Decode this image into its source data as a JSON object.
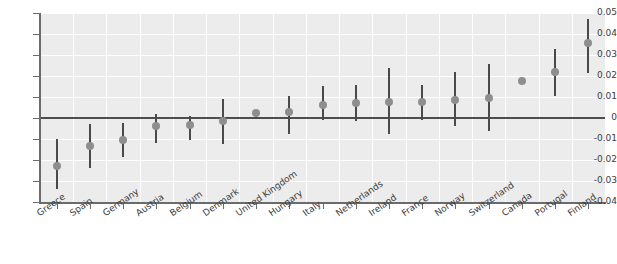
{
  "chart_data": {
    "type": "scatter",
    "title": "",
    "subtitle": "",
    "xlabel": "",
    "ylabel": "",
    "ylim": [
      -0.04,
      0.05
    ],
    "ytick_labels": [
      "0.05",
      "0.04",
      "0.03",
      "0.02",
      "0.01",
      "0",
      "-0.01",
      "-0.02",
      "-0.03",
      "-0.04"
    ],
    "ytick_values": [
      0.05,
      0.04,
      0.03,
      0.02,
      0.01,
      0,
      -0.01,
      -0.02,
      -0.03,
      -0.04
    ],
    "grid": true,
    "legend": "none",
    "zero_reference_line": 0,
    "error_bar_style": "vertical-line",
    "marker": "circle",
    "marker_color": "#8e8e8e",
    "errorbar_color": "#4a4a4a",
    "plot_background": "#ececec",
    "gridline_color": "#ffffff",
    "categories": [
      "Greece",
      "Spain",
      "Germany",
      "Austria",
      "Belgium",
      "Denmark",
      "United Kingdom",
      "Hungary",
      "Italy",
      "Netherlands",
      "Ireland",
      "France",
      "Norway",
      "Switzerland",
      "Canada",
      "Portugal",
      "Finland"
    ],
    "values": [
      -0.023,
      -0.0135,
      -0.0105,
      -0.004,
      -0.0035,
      -0.0015,
      0.0022,
      0.0028,
      0.0062,
      0.0072,
      0.0075,
      0.0078,
      0.0085,
      0.0095,
      0.0176,
      0.0218,
      0.0355
    ],
    "ci_low": [
      -0.034,
      -0.024,
      -0.0185,
      -0.012,
      -0.0105,
      -0.0125,
      -0.0005,
      -0.0075,
      -0.001,
      -0.0015,
      -0.0075,
      -0.001,
      -0.004,
      -0.006,
      0.0162,
      0.0105,
      0.0215
    ],
    "ci_high": [
      -0.01,
      -0.003,
      -0.0025,
      0.002,
      0.0008,
      0.0092,
      0.004,
      0.0105,
      0.0152,
      0.0155,
      0.024,
      0.0155,
      0.022,
      0.0255,
      0.019,
      0.033,
      0.047
    ]
  }
}
